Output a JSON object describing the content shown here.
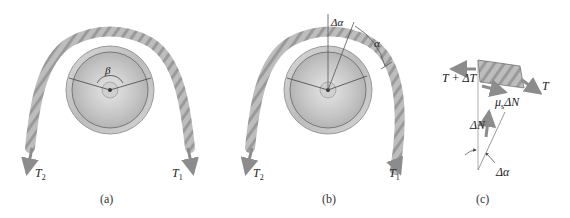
{
  "panels": [
    {
      "id": "a",
      "caption": "(a)",
      "labels": {
        "left_tension": "T",
        "left_sub": "2",
        "right_tension": "T",
        "right_sub": "1",
        "angle": "β"
      }
    },
    {
      "id": "b",
      "caption": "(b)",
      "labels": {
        "left_tension": "T",
        "left_sub": "2",
        "right_tension": "T",
        "right_sub": "1",
        "delta_angle": "Δα",
        "angle": "α"
      }
    },
    {
      "id": "c",
      "caption": "(c)",
      "labels": {
        "tension_plus": "T + ΔT",
        "tension": "T",
        "friction": "μ",
        "friction_sub": "s",
        "friction_rest": "ΔN",
        "normal": "ΔN",
        "delta_angle": "Δα"
      }
    }
  ],
  "colors": {
    "rope": "#b5b5b5",
    "rope_dark": "#8a8a8a",
    "pulley_outer": "#c8c8c8",
    "pulley_inner": "#bdbdbd",
    "arrow": "#8c8c8c",
    "line": "#555555"
  }
}
